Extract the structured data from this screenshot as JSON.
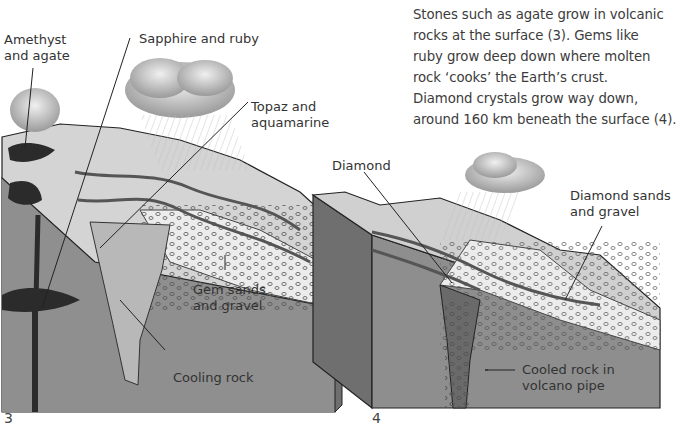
{
  "caption": {
    "lines": [
      "Stones such as agate grow in volcanic",
      "rocks at the surface (3). Gems like",
      "ruby grow deep down where molten",
      "rock ‘cooks’ the Earth’s crust.",
      "Diamond crystals grow way down,",
      "around 160 km beneath the surface (4)."
    ]
  },
  "figure3": {
    "number": "3",
    "labels": {
      "amethyst_agate": [
        "Amethyst",
        "and agate"
      ],
      "sapphire_ruby": "Sapphire and ruby",
      "topaz_aquamarine": [
        "Topaz and",
        "aquamarine"
      ],
      "gem_sands": [
        "Gem sands",
        "and gravel"
      ],
      "cooling_rock": "Cooling rock"
    }
  },
  "figure4": {
    "number": "4",
    "labels": {
      "diamond": "Diamond",
      "diamond_sands": [
        "Diamond sands",
        "and gravel"
      ],
      "cooled_rock": [
        "Cooled rock in",
        "volcano pipe"
      ]
    }
  },
  "colors": {
    "rock_face": "#8e8e8e",
    "rock_dark": "#6f6f6f",
    "surface_light": "#d9d9d9",
    "gravel": "#ececec",
    "magma_dark": "#2b2b2b",
    "cloud": "#b5b5b5"
  }
}
